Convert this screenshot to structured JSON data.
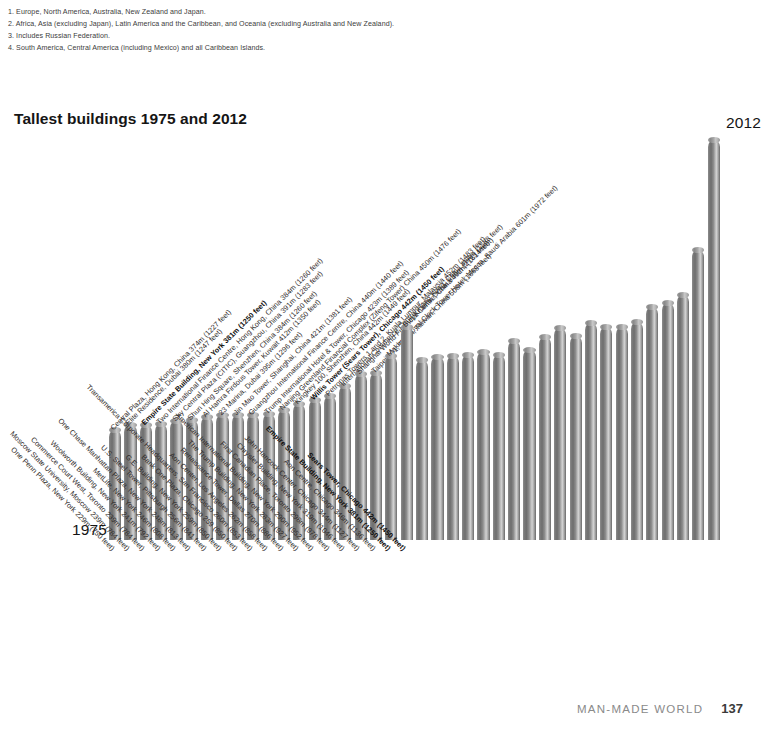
{
  "footnotes": [
    "1. Europe, North America, Australia, New Zealand and Japan.",
    "2. Africa, Asia (excluding Japan), Latin America and the Caribbean, and Oceania (excluding Australia and New Zealand).",
    "3. Includes Russian Federation.",
    "4. South America, Central America (including Mexico) and all Caribbean Islands."
  ],
  "footer": {
    "section": "MAN-MADE WORLD",
    "page": "137"
  },
  "era": {
    "left_label": "1975",
    "right_label": "2012"
  },
  "chart_data": {
    "type": "bar",
    "title": "Tallest buildings 1975 and 2012",
    "xlabel": "",
    "ylabel": "",
    "ylim": [
      0,
      830
    ],
    "grid": false,
    "legend": "none",
    "units": "metres (feet)",
    "series_note": "Left-hand labels describe the 1975 ranking; right-hand labels describe the 2012 ranking. Each bar height equals the 2012 building height.",
    "categories": [
      "One Penn Plaza, New York",
      "Moscow State University, Moscow",
      "Commerce Court West, Toronto",
      "Woolworth Building, New York",
      "MetLife, New York",
      "One Chase Manhattan Plaza, New York",
      "U.S. Steel Tower, Pittsburgh",
      "G.E. Building, New York",
      "Bank One Plaza, Chicago",
      "Transamerica Corporate Headquarters, San Francisco",
      "Aon Center, Los Angeles",
      "Renaissance Tower, Dallas",
      "The Trump Building, New York",
      "American International Building, New York",
      "First Canadian Place, Toronto",
      "Chrysler Building, New York",
      "John Hancock Center, Chicago",
      "Aon Centre, Chicago",
      "Empire State Building, New York",
      "Sears Tower, Chicago",
      "Central Plaza, Hong Kong, China",
      "Elite Residence, Dubai",
      "Empire State Building, New York",
      "Two International Finance Centre, Hong Kong, China",
      "Sky Central Plaza (CITIC), Guangzhou, China",
      "Shun Hing Square, Shenzhen, China",
      "Al Hamra Firdous Tower, Kuwait",
      "23 Marina, Dubai",
      "Jin Mao Tower, Shanghai, China",
      "Guangzhou International Finance Centre, China",
      "Trump International Hotel & Tower, Chicago",
      "Nanjing Greenland Financial Complex (Zifeng Tower) China",
      "Kingkey 100, Shenzhen, China",
      "Willis Tower (Sears Tower), Chicago",
      "Petronas Towers 1 and 2, Kuala Lumpur, Malaysia",
      "International Commerce Centre, Hong Kong, China",
      "Shanghai World Financial Centre, China",
      "Taipei 101, Taipei, Taiwan, China",
      "Makkah Royal Clock Tower Hotel, Mecca, Saudi Arabia",
      "Burj Khalifa, Dubai"
    ],
    "values": [
      229,
      239,
      239,
      241,
      246,
      248,
      256,
      259,
      259,
      260,
      262,
      270,
      283,
      290,
      298,
      319,
      344,
      346,
      381,
      442,
      374,
      380,
      381,
      384,
      391,
      384,
      412,
      395,
      421,
      440,
      423,
      450,
      442,
      442,
      452,
      484,
      492,
      508,
      601,
      830
    ],
    "bars_1975": [
      {
        "rank": 1,
        "name": "One Penn Plaza, New York",
        "metres": 229,
        "feet": 750,
        "label": "One Penn Plaza, New York  229m (750 feet)",
        "bold": false
      },
      {
        "rank": 2,
        "name": "Moscow State University, Moscow",
        "metres": 239,
        "feet": 784,
        "label": "Moscow State University, Moscow  239m (784 feet)",
        "bold": false
      },
      {
        "rank": 3,
        "name": "Commerce Court West, Toronto",
        "metres": 239,
        "feet": 784,
        "label": "Commerce Court West, Toronto  239m (784 feet)",
        "bold": false
      },
      {
        "rank": 4,
        "name": "Woolworth Building, New York",
        "metres": 241,
        "feet": 792,
        "label": "Woolworth Building, New York  241m (792 feet)",
        "bold": false
      },
      {
        "rank": 5,
        "name": "MetLife, New York",
        "metres": 246,
        "feet": 808,
        "label": "MetLife, New York  246m (808 feet)",
        "bold": false
      },
      {
        "rank": 6,
        "name": "One Chase Manhattan Plaza, New York",
        "metres": 248,
        "feet": 813,
        "label": "One Chase Manhattan Plaza, New York  248m (813 feet)",
        "bold": false
      },
      {
        "rank": 7,
        "name": "U.S. Steel Tower, Pittsburgh",
        "metres": 256,
        "feet": 841,
        "label": "U.S. Steel Tower, Pittsburgh  256m (841 feet)",
        "bold": false
      },
      {
        "rank": 8,
        "name": "G.E. Building, New York",
        "metres": 259,
        "feet": 850,
        "label": "G.E. Building, New York  259m (850 feet)",
        "bold": false
      },
      {
        "rank": 9,
        "name": "Bank One Plaza, Chicago",
        "metres": 259,
        "feet": 850,
        "label": "Bank One Plaza, Chicago  259 (850 feet)",
        "bold": false
      },
      {
        "rank": 10,
        "name": "Transamerica Corporate Headquarters, San Francisco",
        "metres": 260,
        "feet": 853,
        "label": "Transamerica Corporate Headquarters, San Francisco  260m (853 feet)",
        "bold": false
      },
      {
        "rank": 11,
        "name": "Aon Center, Los Angeles",
        "metres": 262,
        "feet": 858,
        "label": "Aon Center, Los Angeles  262m (858 feet)",
        "bold": false
      },
      {
        "rank": 12,
        "name": "Renaissance Tower, Dallas",
        "metres": 270,
        "feet": 886,
        "label": "Renaissance Tower, Dallas  270m (886 feet)",
        "bold": false
      },
      {
        "rank": 13,
        "name": "The Trump Building, New York",
        "metres": 283,
        "feet": 927,
        "label": "The Trump Building, New York  283m (927 feet)",
        "bold": false
      },
      {
        "rank": 14,
        "name": "American International Building, New York",
        "metres": 290,
        "feet": 952,
        "label": "American International Building, New York  290m (952 feet)",
        "bold": false
      },
      {
        "rank": 15,
        "name": "First Canadian Place, Toronto",
        "metres": 298,
        "feet": 978,
        "label": "First Canadian Place, Toronto  298m (978 feet)",
        "bold": false
      },
      {
        "rank": 16,
        "name": "Chrysler Building, New York",
        "metres": 319,
        "feet": 1046,
        "label": "Chrysler Building, New York  319m (1046 feet)",
        "bold": false
      },
      {
        "rank": 17,
        "name": "John Hancock Center, Chicago",
        "metres": 344,
        "feet": 1127,
        "label": "John Hancock Center, Chicago  344m (1127 feet)",
        "bold": false
      },
      {
        "rank": 18,
        "name": "Aon Centre, Chicago",
        "metres": 346,
        "feet": 1136,
        "label": "Aon Centre, Chicago  346m (1136 feet)",
        "bold": false
      },
      {
        "rank": 19,
        "name": "Empire State Building, New York",
        "metres": 381,
        "feet": 1250,
        "label": "Empire State Building, New York  381m (1250 feet)",
        "bold": true
      },
      {
        "rank": 20,
        "name": "Sears Tower, Chicago",
        "metres": 442,
        "feet": 1450,
        "label": "Sears Tower, Chicago  442m (1450 feet)",
        "bold": true
      }
    ],
    "bars_2012": [
      {
        "rank": 1,
        "name": "Central Plaza, Hong Kong, China",
        "metres": 374,
        "feet": 1227,
        "label": "Central Plaza, Hong Kong, China  374m (1227 feet)",
        "bold": false
      },
      {
        "rank": 2,
        "name": "Elite Residence, Dubai",
        "metres": 380,
        "feet": 1247,
        "label": "Elite Residence, Dubai  380m (1247 feet)",
        "bold": false
      },
      {
        "rank": 3,
        "name": "Empire State Building, New York",
        "metres": 381,
        "feet": 1250,
        "label": "Empire State Building, New York  381m (1250 feet)",
        "bold": true
      },
      {
        "rank": 4,
        "name": "Two International Finance Centre, Hong Kong, China",
        "metres": 384,
        "feet": 1260,
        "label": "Two International Finance Centre, Hong Kong, China  384m (1260 feet)",
        "bold": false
      },
      {
        "rank": 5,
        "name": "Sky Central Plaza (CITIC), Guangzhou, China",
        "metres": 391,
        "feet": 1283,
        "label": "Sky Central Plaza (CITIC), Guangzhou, China  391m (1283 feet)",
        "bold": false
      },
      {
        "rank": 6,
        "name": "Shun Hing Square, Shenzhen, China",
        "metres": 384,
        "feet": 1260,
        "label": "Shun Hing Square, Shenzhen, China  384m (1260 feet)",
        "bold": false
      },
      {
        "rank": 7,
        "name": "Al Hamra Firdous Tower, Kuwait",
        "metres": 412,
        "feet": 1350,
        "label": "Al Hamra Firdous Tower, Kuwait  412m (1350 feet)",
        "bold": false
      },
      {
        "rank": 8,
        "name": "23 Marina, Dubai",
        "metres": 395,
        "feet": 1296,
        "label": "23 Marina, Dubai  395m (1296 feet)",
        "bold": false
      },
      {
        "rank": 9,
        "name": "Jin Mao Tower, Shanghai, China",
        "metres": 421,
        "feet": 1381,
        "label": "Jin Mao Tower, Shanghai, China  421m (1381 feet)",
        "bold": false
      },
      {
        "rank": 10,
        "name": "Guangzhou International Finance Centre, China",
        "metres": 440,
        "feet": 1440,
        "label": "Guangzhou International Finance Centre, China  440m (1440 feet)",
        "bold": false
      },
      {
        "rank": 11,
        "name": "Trump International Hotel & Tower, Chicago",
        "metres": 423,
        "feet": 1389,
        "label": "Trump International Hotel & Tower, Chicago  423m (1389 feet)",
        "bold": false
      },
      {
        "rank": 12,
        "name": "Nanjing Greenland Financial Complex (Zifeng Tower) China",
        "metres": 450,
        "feet": 1476,
        "label": "Nanjing Greenland Financial Complex (Zifeng Tower) China  450m (1476 feet)",
        "bold": false
      },
      {
        "rank": 13,
        "name": "Kingkey 100, Shenzhen, China",
        "metres": 442,
        "feet": 1449,
        "label": "Kingkey 100, Shenzhen, China  442m (1449 feet)",
        "bold": false
      },
      {
        "rank": 14,
        "name": "Willis Tower (Sears Tower), Chicago",
        "metres": 442,
        "feet": 1450,
        "label": "Willis Tower (Sears Tower), Chicago  442m (1450 feet)",
        "bold": true
      },
      {
        "rank": 15,
        "name": "Petronas Towers 1 and 2, Kuala Lumpur, Malaysia",
        "metres": 452,
        "feet": 1483,
        "label": "Petronas Towers 1 and 2, Kuala Lumpur, Malaysia  452m (1483 feet)",
        "bold": false
      },
      {
        "rank": 16,
        "name": "International Commerce Centre, Hong Kong, China",
        "metres": 484,
        "feet": 1588,
        "label": "International Commerce Centre, Hong Kong, China  484m (1588 feet)",
        "bold": false
      },
      {
        "rank": 17,
        "name": "Shanghai World Financial Centre, China",
        "metres": 492,
        "feet": 1614,
        "label": "Shanghai World Financial Centre, China  492m (1614 feet)",
        "bold": false
      },
      {
        "rank": 18,
        "name": "Taipei 101, Taipei, Taiwan, China",
        "metres": 508,
        "feet": 1668,
        "label": "Taipei 101, Taipei, Taiwan, China  508m (1668 feet)",
        "bold": false
      },
      {
        "rank": 19,
        "name": "Makkah Royal Clock Tower Hotel, Mecca, Saudi Arabia",
        "metres": 601,
        "feet": 1972,
        "label": "Makkah Royal Clock Tower Hotel, Mecca, Saudi Arabia  601m (1972 feet)",
        "bold": false
      },
      {
        "rank": 20,
        "name": "Burj Khalifa, Dubai",
        "metres": 830,
        "feet": 2723,
        "label": "Burj Khalifa, Dubai  830m (2723 feet)",
        "bold": false
      }
    ]
  }
}
